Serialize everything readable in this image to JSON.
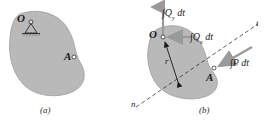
{
  "figure": {
    "panels": [
      {
        "id": "a",
        "caption": "(a)",
        "points": [
          {
            "name": "O",
            "label": "O"
          },
          {
            "name": "A",
            "label": "A"
          }
        ],
        "support": "pin-support-hatched"
      },
      {
        "id": "b",
        "caption": "(b)",
        "points": [
          {
            "name": "O",
            "label": "O"
          },
          {
            "name": "A",
            "label": "A"
          }
        ],
        "vectors": [
          {
            "name": "impulse-qy",
            "label": "∫Q",
            "sub": "y",
            "suffix": " dt",
            "direction": "up"
          },
          {
            "name": "impulse-qx",
            "label": "∫Q",
            "sub": "x",
            "suffix": " dt",
            "direction": "right"
          },
          {
            "name": "impulse-p",
            "label": "∫P dt",
            "sub": "",
            "suffix": "",
            "direction": "down-left"
          },
          {
            "name": "position-vector",
            "label": "r",
            "sub": "",
            "suffix": "",
            "direction": "O-to-A"
          }
        ],
        "axes": [
          {
            "name": "axis-n",
            "label": "n"
          },
          {
            "name": "axis-t",
            "label": "t"
          }
        ]
      }
    ],
    "colors": {
      "body_fill": "#b9b9b9",
      "body_stroke": "#8f8f8f",
      "arrow_gray": "#9a9a9a",
      "line_dark": "#1a1a1a",
      "background": "#ffffff"
    }
  }
}
